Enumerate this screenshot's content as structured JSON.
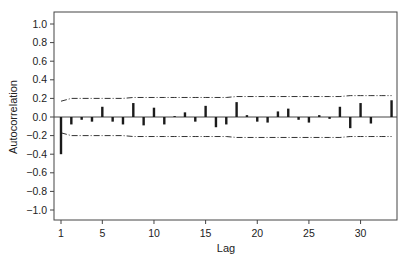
{
  "chart_data": {
    "type": "bar",
    "title": "",
    "xlabel": "Lag",
    "ylabel": "Autocorrelation",
    "ylim": [
      -1.1,
      1.1
    ],
    "yticks": [
      1.0,
      0.8,
      0.6,
      0.4,
      0.2,
      0.0,
      -0.2,
      -0.4,
      -0.6,
      -0.8,
      -1.0
    ],
    "ytick_labels": [
      "1.0",
      "0.8",
      "0.6",
      "0.4",
      "0.2",
      "0.0",
      "−0.2",
      "−0.4",
      "−0.6",
      "−0.8",
      "−1.0"
    ],
    "xticks": [
      1,
      5,
      10,
      15,
      20,
      25,
      30
    ],
    "xlim": [
      0.5,
      34
    ],
    "grid": false,
    "legend": null,
    "lags": [
      1,
      2,
      3,
      4,
      5,
      6,
      7,
      8,
      9,
      10,
      11,
      12,
      13,
      14,
      15,
      16,
      17,
      18,
      19,
      20,
      21,
      22,
      23,
      24,
      25,
      26,
      27,
      28,
      29,
      30,
      31,
      32,
      33
    ],
    "values": [
      -0.4,
      -0.08,
      -0.03,
      -0.05,
      0.11,
      -0.05,
      -0.08,
      0.15,
      -0.09,
      0.1,
      -0.08,
      0.01,
      0.05,
      -0.05,
      0.12,
      -0.11,
      -0.08,
      0.16,
      0.02,
      -0.05,
      -0.06,
      0.06,
      0.09,
      -0.03,
      -0.06,
      0.02,
      -0.02,
      0.11,
      -0.12,
      0.15,
      -0.07,
      0.0,
      0.18
    ],
    "confidence_upper": [
      0.17,
      0.2,
      0.2,
      0.2,
      0.2,
      0.2,
      0.2,
      0.21,
      0.21,
      0.21,
      0.21,
      0.21,
      0.21,
      0.21,
      0.21,
      0.21,
      0.21,
      0.22,
      0.22,
      0.22,
      0.22,
      0.22,
      0.22,
      0.22,
      0.22,
      0.22,
      0.22,
      0.22,
      0.23,
      0.23,
      0.23,
      0.23,
      0.23
    ],
    "confidence_lower": [
      -0.17,
      -0.2,
      -0.2,
      -0.2,
      -0.2,
      -0.2,
      -0.2,
      -0.21,
      -0.21,
      -0.21,
      -0.21,
      -0.21,
      -0.21,
      -0.21,
      -0.21,
      -0.21,
      -0.21,
      -0.22,
      -0.22,
      -0.22,
      -0.22,
      -0.22,
      -0.22,
      -0.22,
      -0.22,
      -0.22,
      -0.22,
      -0.22,
      -0.21,
      -0.21,
      -0.21,
      -0.21,
      -0.21
    ]
  },
  "colors": {
    "bar": "#1a1a1a",
    "axis": "#444444",
    "bounds": "#333333"
  }
}
